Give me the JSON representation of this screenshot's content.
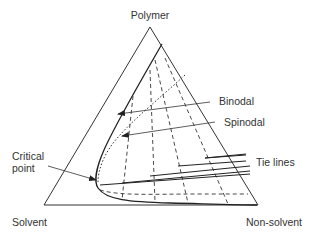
{
  "diagram": {
    "type": "ternary-phase-diagram",
    "vertices": {
      "top": "Polymer",
      "bottom_left": "Solvent",
      "bottom_right": "Non-solvent"
    },
    "annotations": {
      "binodal": "Binodal",
      "spinodal": "Spinodal",
      "critical_point_line1": "Critical",
      "critical_point_line2": "point",
      "tie_lines": "Tie lines"
    },
    "colors": {
      "line": "#333333",
      "background": "#ffffff"
    }
  }
}
